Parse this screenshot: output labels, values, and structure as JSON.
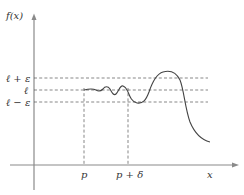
{
  "diagram": {
    "y_axis_label": "f(x)",
    "x_axis_label": "x",
    "levels": [
      {
        "id": "upper",
        "label": "ℓ + ε"
      },
      {
        "id": "center",
        "label": "ℓ"
      },
      {
        "id": "lower",
        "label": "ℓ − ε"
      }
    ],
    "x_marks": [
      {
        "id": "p",
        "label": "p"
      },
      {
        "id": "p-plus-delta",
        "label": "p + δ"
      }
    ]
  }
}
